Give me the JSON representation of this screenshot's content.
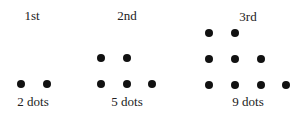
{
  "diagram": {
    "type": "dot-pattern-sequence",
    "dot_color": "#111111",
    "terms": [
      {
        "title": "1st",
        "caption": "2 dots",
        "count": 2,
        "title_pos": [
          32,
          15
        ],
        "caption_pos": [
          33,
          101
        ],
        "dots": [
          [
            21,
            84
          ],
          [
            47,
            84
          ]
        ]
      },
      {
        "title": "2nd",
        "caption": "5 dots",
        "count": 5,
        "title_pos": [
          127,
          15
        ],
        "caption_pos": [
          127,
          101
        ],
        "dots": [
          [
            101,
            58
          ],
          [
            127,
            58
          ],
          [
            101,
            84
          ],
          [
            127,
            84
          ],
          [
            152,
            84
          ]
        ]
      },
      {
        "title": "3rd",
        "caption": "9 dots",
        "count": 9,
        "title_pos": [
          248,
          16
        ],
        "caption_pos": [
          248,
          101
        ],
        "dots": [
          [
            209,
            33
          ],
          [
            235,
            33
          ],
          [
            209,
            59
          ],
          [
            235,
            59
          ],
          [
            261,
            59
          ],
          [
            209,
            85
          ],
          [
            235,
            85
          ],
          [
            261,
            85
          ],
          [
            286,
            85
          ]
        ]
      }
    ]
  }
}
